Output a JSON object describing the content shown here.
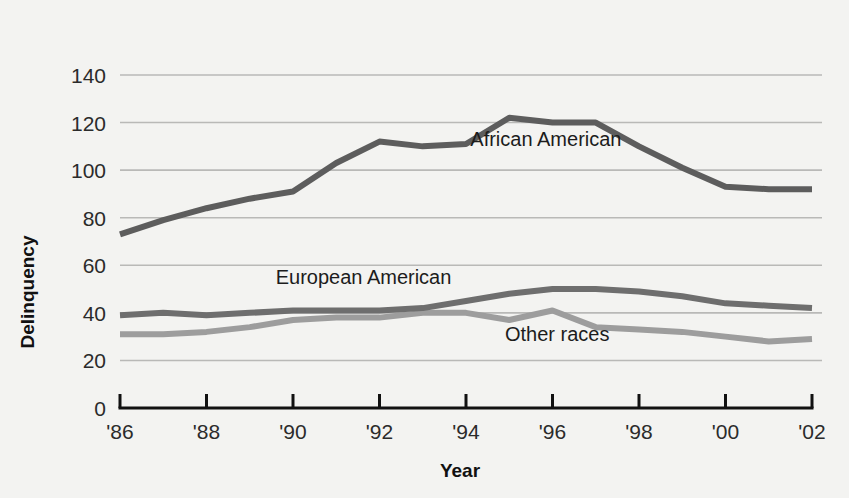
{
  "chart_data": {
    "type": "line",
    "title": "",
    "xlabel": "Year",
    "ylabel": "Delinquency",
    "x": [
      1986,
      1987,
      1988,
      1989,
      1990,
      1991,
      1992,
      1993,
      1994,
      1995,
      1996,
      1997,
      1998,
      1999,
      2000,
      2001,
      2002
    ],
    "xtick_labels": [
      "'86",
      "'88",
      "'90",
      "'92",
      "'94",
      "'96",
      "'98",
      "'00",
      "'02"
    ],
    "xtick_values": [
      1986,
      1988,
      1990,
      1992,
      1994,
      1996,
      1998,
      2000,
      2002
    ],
    "ytick_labels": [
      "0",
      "20",
      "40",
      "60",
      "80",
      "100",
      "120",
      "140"
    ],
    "ytick_values": [
      0,
      20,
      40,
      60,
      80,
      100,
      120,
      140
    ],
    "ylim": [
      0,
      148
    ],
    "xlim": [
      1986,
      2002
    ],
    "grid": "horizontal",
    "legend": "inline-labels",
    "series": [
      {
        "name": "African American",
        "color": "#5d5d5d",
        "label_x": 1994.1,
        "label_y": 110,
        "values": [
          73,
          79,
          84,
          88,
          91,
          103,
          112,
          110,
          111,
          122,
          120,
          120,
          110,
          101,
          93,
          92,
          92
        ]
      },
      {
        "name": "European American",
        "color": "#6e6e6e",
        "label_x": 1989.6,
        "label_y": 52,
        "values": [
          39,
          40,
          39,
          40,
          41,
          41,
          41,
          42,
          45,
          48,
          50,
          50,
          49,
          47,
          44,
          43,
          42
        ]
      },
      {
        "name": "Other races",
        "color": "#9d9d9d",
        "label_x": 1994.9,
        "label_y": 28,
        "values": [
          31,
          31,
          32,
          34,
          37,
          38,
          38,
          40,
          40,
          37,
          41,
          34,
          33,
          32,
          30,
          28,
          29
        ]
      }
    ]
  },
  "axis": {
    "y_title": "Delinquency",
    "x_title": "Year"
  }
}
